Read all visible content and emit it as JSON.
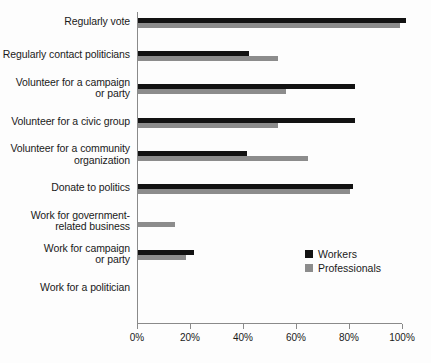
{
  "chart_data": {
    "type": "bar",
    "orientation": "horizontal",
    "title": "",
    "xlabel": "",
    "ylabel": "",
    "xlim": [
      0,
      100
    ],
    "xticks": [
      0,
      20,
      40,
      60,
      80,
      100
    ],
    "xtick_labels": [
      "0%",
      "20%",
      "40%",
      "60%",
      "80%",
      "100%"
    ],
    "grid": false,
    "legend_position": "lower-right",
    "categories": [
      "Regularly vote",
      "Regularly contact politicians",
      "Volunteer for a campaign or party",
      "Volunteer for a civic group",
      "Volunteer for a community organization",
      "Donate to politics",
      "Work for government-related business",
      "Work for campaign or party",
      "Work for a politician"
    ],
    "series": [
      {
        "name": "Workers",
        "color": "#121212",
        "values": [
          101,
          42,
          82,
          82,
          41,
          81,
          0,
          21,
          0
        ]
      },
      {
        "name": "Professionals",
        "color": "#8c8c8c",
        "values": [
          99,
          53,
          56,
          53,
          64,
          80,
          14,
          18,
          0
        ]
      }
    ]
  },
  "category_label_lines": [
    [
      "Regularly vote"
    ],
    [
      "Regularly contact politicians"
    ],
    [
      "Volunteer for a campaign",
      "or party"
    ],
    [
      "Volunteer for a civic group"
    ],
    [
      "Volunteer for a community",
      "organization"
    ],
    [
      "Donate to politics"
    ],
    [
      "Work for government-",
      "related business"
    ],
    [
      "Work for campaign",
      "or party"
    ],
    [
      "Work for a politician"
    ]
  ],
  "legend": {
    "items": [
      {
        "label": "Workers",
        "color": "#121212"
      },
      {
        "label": "Professionals",
        "color": "#8c8c8c"
      }
    ]
  },
  "colors": {
    "axis": "#8a8a8a",
    "text": "#1a1a1a",
    "background": "#fdfdfd",
    "workers": "#121212",
    "professionals": "#8c8c8c"
  }
}
